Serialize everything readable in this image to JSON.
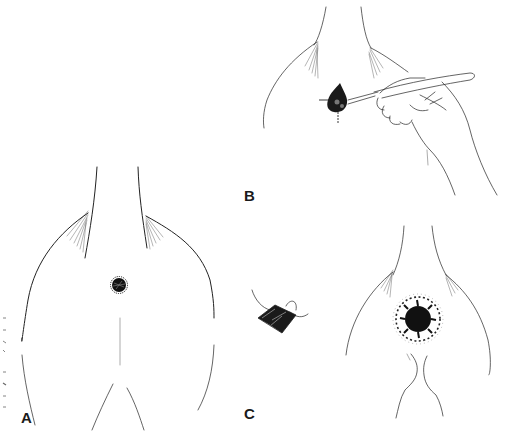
{
  "figure": {
    "type": "surgical-illustration",
    "background": "#ffffff",
    "ink_color": "#222222",
    "panels": [
      {
        "id": "A",
        "label": "A",
        "description": "anterior neck/chest outline with small dark round lesion"
      },
      {
        "id": "B",
        "label": "B",
        "description": "hand holding scalpel incising around lesion along cross-hair markings"
      },
      {
        "id": "C",
        "label": "C",
        "description": "excised lesion specimen with suture and circular wound with sutured margins"
      }
    ]
  },
  "labels": {
    "a": "A",
    "b": "B",
    "c": "C"
  }
}
